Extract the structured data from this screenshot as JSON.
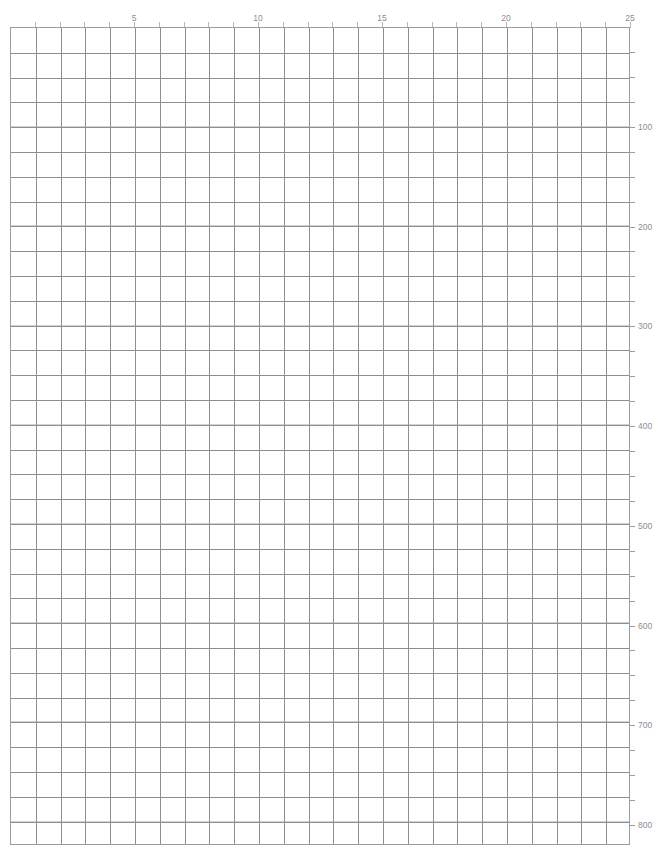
{
  "page": {
    "width": 662,
    "height": 859,
    "background_color": "#ffffff",
    "clipped_header_text": "—  ——  ——  ——   ———   — —        ——"
  },
  "style": {
    "major_line_color": "#8e8e94",
    "minor_line_color": "#d2d2d6",
    "border_color": "#9c9ca1",
    "label_color": "#8d8d92",
    "tick_color": "#b5b5ba"
  },
  "chart_data": {
    "type": "grid",
    "title": "",
    "subtitle": "",
    "xlabel": "",
    "ylabel": "",
    "grid": true,
    "legend": null,
    "columns": 25,
    "rows": 33,
    "cell_width_px": 24.8,
    "cell_height_px": 24.8,
    "plot_left_px": 10,
    "plot_top_px": 27,
    "plot_width_px": 620,
    "plot_height_px": 818,
    "xaxis": {
      "position": "top",
      "min": 0,
      "max": 25,
      "tick_interval": 1,
      "label_interval": 5,
      "labels": [
        "5",
        "10",
        "15",
        "20",
        "25"
      ],
      "label_values": [
        5,
        10,
        15,
        20,
        25
      ]
    },
    "yaxis": {
      "position": "right",
      "min": 0,
      "max": 820,
      "tick_interval": 25,
      "label_interval": 100,
      "labels": [
        "100",
        "200",
        "300",
        "400",
        "500",
        "600",
        "700",
        "800"
      ],
      "label_values": [
        100,
        200,
        300,
        400,
        500,
        600,
        700,
        800
      ],
      "px_per_100_units": 102.3
    },
    "series": [],
    "values": [],
    "annotations": []
  }
}
